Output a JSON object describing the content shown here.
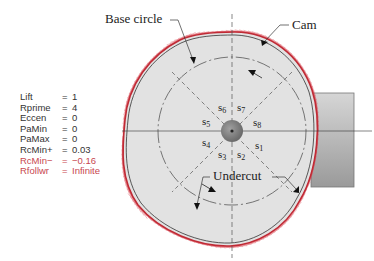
{
  "diagram": {
    "labels": {
      "base_circle": "Base circle",
      "cam": "Cam",
      "undercut": "Undercut"
    },
    "segments": [
      "s1",
      "s2",
      "s3",
      "s4",
      "s5",
      "s6",
      "s7",
      "s8"
    ],
    "parameters": [
      {
        "name": "Lift",
        "eq": "=",
        "value": "1",
        "highlight": false
      },
      {
        "name": "Rprime",
        "eq": "=",
        "value": "4",
        "highlight": false
      },
      {
        "name": "Eccen",
        "eq": "=",
        "value": "0",
        "highlight": false
      },
      {
        "name": "PaMin",
        "eq": "=",
        "value": "0",
        "highlight": false
      },
      {
        "name": "PaMax",
        "eq": "=",
        "value": "0",
        "highlight": false
      },
      {
        "name": "RcMin+",
        "eq": "=",
        "value": "0.03",
        "highlight": false
      },
      {
        "name": "RcMin−",
        "eq": "=",
        "value": "−0.16",
        "highlight": true
      },
      {
        "name": "Rfollwr",
        "eq": "=",
        "value": "Infinite",
        "highlight": true
      }
    ],
    "colors": {
      "envelope_lines": "#d9434f",
      "cam_fill": "#e2e2e2",
      "hub": "#808080",
      "follower": "#b4b4b4",
      "highlight_text": "#c8464f"
    }
  }
}
